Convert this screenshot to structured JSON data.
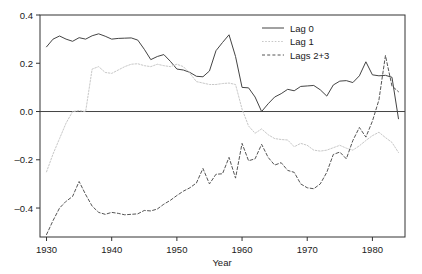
{
  "chart_data": {
    "type": "line",
    "title": "",
    "xlabel": "Year",
    "ylabel": "",
    "xlim": [
      1929,
      1985
    ],
    "ylim": [
      -0.52,
      0.4
    ],
    "xticks": [
      1930,
      1940,
      1950,
      1960,
      1970,
      1980
    ],
    "xticklabels": [
      "1930",
      "1940",
      "1950",
      "1960",
      "1970",
      "1980"
    ],
    "yticks": [
      0.4,
      0.2,
      0.0,
      -0.2,
      -0.4
    ],
    "yticklabels": [
      "0.4",
      "0.2",
      "0.0",
      "‒0.2",
      "‒0.4"
    ],
    "grid": false,
    "zero_line": true,
    "legend_position": "top-right",
    "series": [
      {
        "name": "Lag 0",
        "style": "solid",
        "color": "#444444",
        "x": [
          1930,
          1931,
          1932,
          1933,
          1934,
          1935,
          1936,
          1937,
          1938,
          1939,
          1940,
          1941,
          1942,
          1943,
          1944,
          1945,
          1946,
          1947,
          1948,
          1949,
          1950,
          1951,
          1952,
          1953,
          1954,
          1955,
          1956,
          1957,
          1958,
          1959,
          1960,
          1961,
          1962,
          1963,
          1964,
          1965,
          1966,
          1967,
          1968,
          1969,
          1970,
          1971,
          1972,
          1973,
          1974,
          1975,
          1976,
          1977,
          1978,
          1979,
          1980,
          1981,
          1982,
          1983,
          1984
        ],
        "values": [
          0.268,
          0.3,
          0.313,
          0.3,
          0.291,
          0.306,
          0.3,
          0.314,
          0.322,
          0.312,
          0.3,
          0.303,
          0.304,
          0.305,
          0.296,
          0.258,
          0.215,
          0.228,
          0.236,
          0.208,
          0.176,
          0.172,
          0.162,
          0.146,
          0.144,
          0.168,
          0.252,
          0.286,
          0.318,
          0.228,
          0.1,
          0.098,
          0.06,
          0.0,
          0.032,
          0.06,
          0.074,
          0.092,
          0.086,
          0.104,
          0.106,
          0.108,
          0.09,
          0.064,
          0.11,
          0.126,
          0.128,
          0.12,
          0.148,
          0.206,
          0.152,
          0.148,
          0.15,
          0.142,
          -0.03
        ]
      },
      {
        "name": "Lag 1",
        "style": "dotted",
        "color": "#c8c8c8",
        "x": [
          1930,
          1931,
          1932,
          1933,
          1934,
          1935,
          1936,
          1937,
          1938,
          1939,
          1940,
          1941,
          1942,
          1943,
          1944,
          1945,
          1946,
          1947,
          1948,
          1949,
          1950,
          1951,
          1952,
          1953,
          1954,
          1955,
          1956,
          1957,
          1958,
          1959,
          1960,
          1961,
          1962,
          1963,
          1964,
          1965,
          1966,
          1967,
          1968,
          1969,
          1970,
          1971,
          1972,
          1973,
          1974,
          1975,
          1976,
          1977,
          1978,
          1979,
          1980,
          1981,
          1982,
          1983,
          1984
        ],
        "values": [
          -0.25,
          -0.176,
          -0.112,
          -0.048,
          0.0,
          0.004,
          0.0,
          0.176,
          0.186,
          0.162,
          0.158,
          0.172,
          0.186,
          0.196,
          0.198,
          0.19,
          0.186,
          0.196,
          0.19,
          0.186,
          0.196,
          0.186,
          0.158,
          0.124,
          0.118,
          0.112,
          0.112,
          0.116,
          0.118,
          0.112,
          0.01,
          -0.06,
          -0.09,
          -0.072,
          -0.096,
          -0.112,
          -0.116,
          -0.118,
          -0.146,
          -0.132,
          -0.14,
          -0.16,
          -0.164,
          -0.16,
          -0.15,
          -0.14,
          -0.152,
          -0.16,
          -0.142,
          -0.12,
          -0.1,
          -0.086,
          -0.108,
          -0.128,
          -0.17
        ]
      },
      {
        "name": "Lags 2+3",
        "style": "dashed",
        "color": "#555555",
        "x": [
          1930,
          1931,
          1932,
          1933,
          1934,
          1935,
          1936,
          1937,
          1938,
          1939,
          1940,
          1941,
          1942,
          1943,
          1944,
          1945,
          1946,
          1947,
          1948,
          1949,
          1950,
          1951,
          1952,
          1953,
          1954,
          1955,
          1956,
          1957,
          1958,
          1959,
          1960,
          1961,
          1962,
          1963,
          1964,
          1965,
          1966,
          1967,
          1968,
          1969,
          1970,
          1971,
          1972,
          1973,
          1974,
          1975,
          1976,
          1977,
          1978,
          1979,
          1980,
          1981,
          1982,
          1983,
          1984
        ],
        "values": [
          -0.51,
          -0.452,
          -0.4,
          -0.372,
          -0.352,
          -0.29,
          -0.344,
          -0.392,
          -0.418,
          -0.426,
          -0.418,
          -0.422,
          -0.428,
          -0.426,
          -0.424,
          -0.41,
          -0.412,
          -0.404,
          -0.384,
          -0.368,
          -0.348,
          -0.33,
          -0.316,
          -0.296,
          -0.236,
          -0.3,
          -0.26,
          -0.258,
          -0.19,
          -0.276,
          -0.132,
          -0.204,
          -0.196,
          -0.136,
          -0.19,
          -0.222,
          -0.212,
          -0.244,
          -0.252,
          -0.3,
          -0.316,
          -0.32,
          -0.3,
          -0.252,
          -0.178,
          -0.168,
          -0.196,
          -0.12,
          -0.066,
          -0.106,
          -0.04,
          0.048,
          0.232,
          0.106,
          0.082
        ]
      }
    ]
  },
  "legend": {
    "items": [
      {
        "label": "Lag 0"
      },
      {
        "label": "Lag 1"
      },
      {
        "label": "Lags 2+3"
      }
    ]
  },
  "axes": {
    "x_title": "Year"
  }
}
